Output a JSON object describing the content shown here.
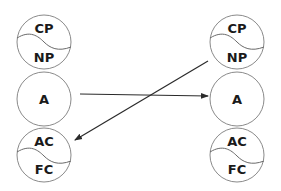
{
  "diagram": {
    "left_column": {
      "top": {
        "upper": "CP",
        "lower": "NP"
      },
      "middle": {
        "label": "A"
      },
      "bottom": {
        "upper": "AC",
        "lower": "FC"
      }
    },
    "right_column": {
      "top": {
        "upper": "CP",
        "lower": "NP"
      },
      "middle": {
        "label": "A"
      },
      "bottom": {
        "upper": "AC",
        "lower": "FC"
      }
    },
    "arrows": [
      {
        "from": "left.A",
        "to": "right.A",
        "direction": "left-to-right"
      },
      {
        "from": "right.NP",
        "to": "left.AC",
        "direction": "right-to-left"
      }
    ],
    "colors": {
      "circle_stroke": "#8a8a8a",
      "arrow": "#2a2a2a",
      "text": "#1a1a1a"
    }
  }
}
